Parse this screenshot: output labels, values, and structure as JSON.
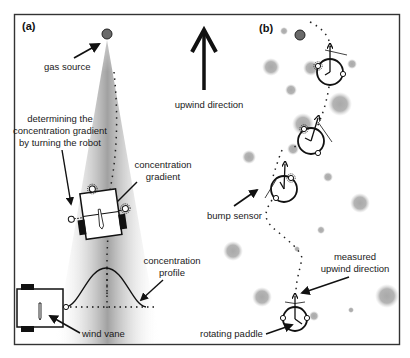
{
  "figure": {
    "panel_a": {
      "label": "(a)",
      "annotations": {
        "gas_source": "gas source",
        "gradient_turn_line1": "determining the",
        "gradient_turn_line2": "concentration gradient",
        "gradient_turn_line3": "by turning the robot",
        "conc_gradient_line1": "concentration",
        "conc_gradient_line2": "gradient",
        "conc_profile_line1": "concentration",
        "conc_profile_line2": "profile",
        "wind_vane": "wind vane"
      }
    },
    "center": {
      "upwind_label": "upwind direction"
    },
    "panel_b": {
      "label": "(b)",
      "annotations": {
        "bump_sensor": "bump sensor",
        "measured_line1": "measured",
        "measured_line2": "upwind direction",
        "rotating_paddle": "rotating paddle"
      }
    },
    "colors": {
      "frame": "#333333",
      "ink": "#111111",
      "plume": "#a8a8a8",
      "gas_patch": "#b0b0b0",
      "source_fill": "#6a6a6a"
    }
  }
}
